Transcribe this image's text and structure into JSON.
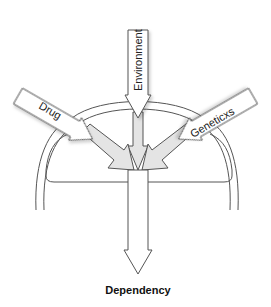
{
  "diagram": {
    "inputs": [
      {
        "id": "environment",
        "label": "Environment"
      },
      {
        "id": "drug",
        "label": "Drug"
      },
      {
        "id": "genetics",
        "label": "Geneticxs"
      }
    ],
    "output": {
      "id": "dependency",
      "label": "Dependency"
    },
    "colors": {
      "stroke": "#555555",
      "arrow_fill": "#ffffff",
      "inner_arrow_fill": "#e4e4e4",
      "shadow": "#d8d8d8",
      "background": "#ffffff"
    }
  }
}
